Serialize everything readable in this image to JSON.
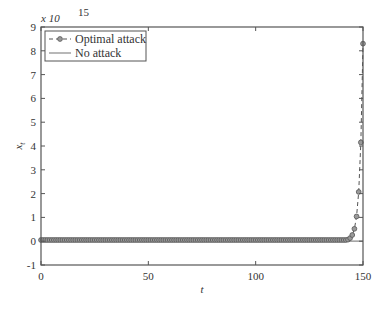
{
  "chart_data": {
    "type": "line",
    "title": "",
    "xlabel": "t",
    "ylabel": "x_t",
    "y_multiplier_label": "x 10",
    "y_multiplier_exponent": "15",
    "xlim": [
      0,
      150
    ],
    "ylim": [
      -1,
      9
    ],
    "xticks": [
      0,
      50,
      100,
      150
    ],
    "yticks": [
      -1,
      0,
      1,
      2,
      3,
      4,
      5,
      6,
      7,
      8,
      9
    ],
    "grid": false,
    "legend_position": "upper left",
    "series": [
      {
        "name": "Optimal attack",
        "style": "dashed-circle-markers",
        "color": "#555555",
        "description": "approximately 0 until t≈140, then doubles each step",
        "x": [
          140,
          141,
          142,
          143,
          144,
          145,
          146,
          147,
          148,
          149,
          150
        ],
        "values": [
          0.008,
          0.016,
          0.032,
          0.065,
          0.13,
          0.26,
          0.52,
          1.04,
          2.07,
          4.15,
          8.3
        ]
      },
      {
        "name": "No attack",
        "style": "solid",
        "color": "#888888",
        "x": [
          0,
          150
        ],
        "values": [
          0,
          0
        ]
      }
    ]
  },
  "legend": {
    "items": [
      "Optimal attack",
      "No attack"
    ]
  }
}
